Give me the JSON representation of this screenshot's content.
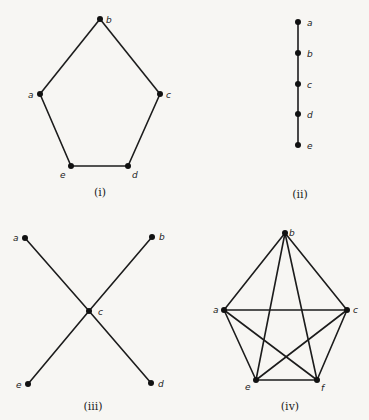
{
  "figure": {
    "colors": {
      "ink": "#1c1c1c",
      "background": "#f7f6f3"
    },
    "graphs": [
      {
        "id": "i",
        "caption": "(i)",
        "caption_pos": [
          100,
          196
        ],
        "description": "5-cycle (pentagon)",
        "vertices": [
          {
            "name": "a",
            "x": 40,
            "y": 94,
            "lx": -12,
            "ly": 4
          },
          {
            "name": "b",
            "x": 100,
            "y": 19,
            "lx": 6,
            "ly": 4
          },
          {
            "name": "c",
            "x": 160,
            "y": 94,
            "lx": 6,
            "ly": 4
          },
          {
            "name": "d",
            "x": 128,
            "y": 166,
            "lx": 4,
            "ly": 12
          },
          {
            "name": "e",
            "x": 71,
            "y": 166,
            "lx": -11,
            "ly": 12
          }
        ],
        "edges": [
          [
            "a",
            "b"
          ],
          [
            "b",
            "c"
          ],
          [
            "c",
            "d"
          ],
          [
            "d",
            "e"
          ],
          [
            "e",
            "a"
          ]
        ]
      },
      {
        "id": "ii",
        "caption": "(ii)",
        "caption_pos": [
          300,
          198
        ],
        "description": "path graph",
        "vertices": [
          {
            "name": "a",
            "x": 298,
            "y": 22,
            "lx": 9,
            "ly": 4
          },
          {
            "name": "b",
            "x": 298,
            "y": 53,
            "lx": 9,
            "ly": 4
          },
          {
            "name": "c",
            "x": 298,
            "y": 84,
            "lx": 9,
            "ly": 4
          },
          {
            "name": "d",
            "x": 298,
            "y": 114,
            "lx": 9,
            "ly": 4
          },
          {
            "name": "e",
            "x": 298,
            "y": 145,
            "lx": 9,
            "ly": 4
          }
        ],
        "edges": [
          [
            "a",
            "b"
          ],
          [
            "b",
            "c"
          ],
          [
            "c",
            "d"
          ],
          [
            "d",
            "e"
          ]
        ]
      },
      {
        "id": "iii",
        "caption": "(iii)",
        "caption_pos": [
          93,
          410
        ],
        "description": "star graph centered at c",
        "vertices": [
          {
            "name": "a",
            "x": 25,
            "y": 238,
            "lx": -12,
            "ly": 3
          },
          {
            "name": "b",
            "x": 152,
            "y": 237,
            "lx": 7,
            "ly": 3
          },
          {
            "name": "c",
            "x": 89,
            "y": 311,
            "lx": 9,
            "ly": 4
          },
          {
            "name": "d",
            "x": 151,
            "y": 383,
            "lx": 7,
            "ly": 4
          },
          {
            "name": "e",
            "x": 28,
            "y": 384,
            "lx": -12,
            "ly": 4
          }
        ],
        "edges": [
          [
            "a",
            "c"
          ],
          [
            "b",
            "c"
          ],
          [
            "c",
            "d"
          ],
          [
            "c",
            "e"
          ]
        ]
      },
      {
        "id": "iv",
        "caption": "(iv)",
        "caption_pos": [
          290,
          410
        ],
        "description": "complete graph K5",
        "vertices": [
          {
            "name": "a",
            "x": 224,
            "y": 310,
            "lx": -11,
            "ly": 3
          },
          {
            "name": "b",
            "x": 285,
            "y": 233,
            "lx": 4,
            "ly": 3
          },
          {
            "name": "c",
            "x": 347,
            "y": 310,
            "lx": 6,
            "ly": 3
          },
          {
            "name": "e",
            "x": 256,
            "y": 380,
            "lx": -11,
            "ly": 10
          },
          {
            "name": "f",
            "x": 317,
            "y": 380,
            "lx": 4,
            "ly": 11
          }
        ],
        "edges": [
          [
            "a",
            "b"
          ],
          [
            "b",
            "c"
          ],
          [
            "a",
            "c"
          ],
          [
            "b",
            "e"
          ],
          [
            "b",
            "f"
          ],
          [
            "a",
            "e"
          ],
          [
            "a",
            "f"
          ],
          [
            "c",
            "e"
          ],
          [
            "c",
            "f"
          ],
          [
            "e",
            "f"
          ]
        ]
      }
    ]
  }
}
